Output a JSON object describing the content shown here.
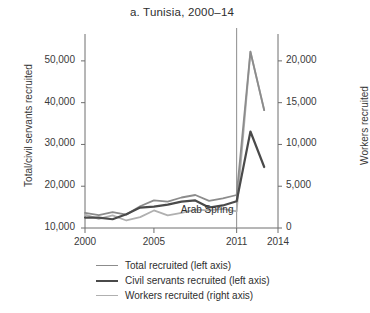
{
  "chart_data": {
    "type": "line",
    "title": "a. Tunisia, 2000–14",
    "xlabel": "",
    "ylabel": "Total/civil servants recruited",
    "y2label": "Workers recruited",
    "x": [
      2000,
      2001,
      2002,
      2003,
      2004,
      2005,
      2006,
      2007,
      2008,
      2009,
      2010,
      2011,
      2012,
      2013
    ],
    "xlim": [
      2000,
      2014
    ],
    "xticks": [
      2000,
      2005,
      2011,
      2014
    ],
    "xtick_labels": [
      "2000",
      "2005",
      "2011",
      "2014"
    ],
    "ylim": [
      10000,
      55000
    ],
    "yticks": [
      10000,
      20000,
      30000,
      40000,
      50000
    ],
    "ytick_labels": [
      "10,000",
      "20,000",
      "30,000",
      "40,000",
      "50,000"
    ],
    "y2lim": [
      0,
      22500
    ],
    "y2ticks": [
      0,
      5000,
      10000,
      15000,
      20000
    ],
    "y2tick_labels": [
      "0",
      "5,000",
      "10,000",
      "15,000",
      "20,000"
    ],
    "grid": false,
    "legend_position": "below",
    "series": [
      {
        "name": "Total recruited (left axis)",
        "axis": "left",
        "color": "#8c8c8c",
        "width": 1.8,
        "values": [
          13600,
          13100,
          13800,
          13200,
          15200,
          16600,
          16300,
          17300,
          17900,
          16500,
          17100,
          17900,
          52200,
          38200
        ]
      },
      {
        "name": "Civil servants recruited (left axis)",
        "axis": "left",
        "color": "#4a4a4a",
        "width": 2.2,
        "values": [
          12500,
          12500,
          12100,
          13300,
          14900,
          15100,
          15600,
          16300,
          16600,
          14900,
          15400,
          16400,
          33100,
          24600
        ]
      },
      {
        "name": "Workers recruited (right axis)",
        "axis": "right",
        "color": "#b0b0b0",
        "width": 1.8,
        "values": [
          1600,
          1100,
          1500,
          900,
          1300,
          2100,
          1500,
          1800,
          2200,
          2100,
          2300,
          2000,
          21100,
          14100
        ]
      }
    ],
    "annotations": [
      {
        "text": "Arab Spring",
        "x": 2011,
        "kind": "vline-label",
        "color": "#8c8c8c"
      }
    ]
  },
  "legend": {
    "items": [
      {
        "label": "Total recruited (left axis)"
      },
      {
        "label": "Civil servants recruited (left axis)"
      },
      {
        "label": "Workers recruited (right axis)"
      }
    ]
  }
}
